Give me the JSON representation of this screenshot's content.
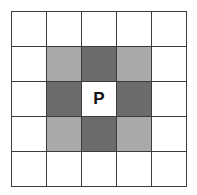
{
  "diagram": {
    "title": "",
    "rows": 5,
    "cols": 5,
    "colors": {
      "empty": "#ffffff",
      "light": "#a9a9a9",
      "dark": "#6b6b6b",
      "center": "#ffffff",
      "border": "#3c3c3c"
    },
    "cells": [
      [
        "empty",
        "empty",
        "empty",
        "empty",
        "empty"
      ],
      [
        "empty",
        "light",
        "dark",
        "light",
        "empty"
      ],
      [
        "empty",
        "dark",
        "center",
        "dark",
        "empty"
      ],
      [
        "empty",
        "light",
        "dark",
        "light",
        "empty"
      ],
      [
        "empty",
        "empty",
        "empty",
        "empty",
        "empty"
      ]
    ],
    "labels": [
      [
        "",
        "",
        "",
        "",
        ""
      ],
      [
        "",
        "",
        "",
        "",
        ""
      ],
      [
        "",
        "",
        "P",
        "",
        ""
      ],
      [
        "",
        "",
        "",
        "",
        ""
      ],
      [
        "",
        "",
        "",
        "",
        ""
      ]
    ]
  }
}
